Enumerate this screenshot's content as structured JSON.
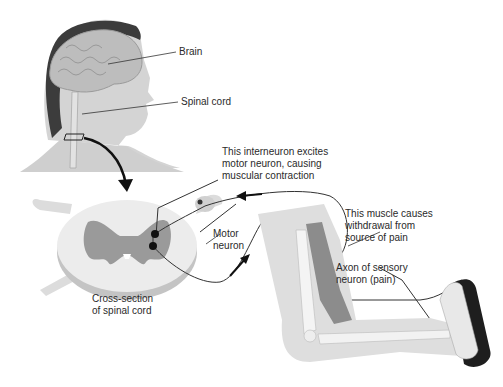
{
  "diagram": {
    "type": "anatomical-illustration",
    "labels": {
      "brain": "Brain",
      "spinal_cord": "Spinal cord",
      "interneuron": [
        "This interneuron excites",
        "motor neuron, causing",
        "muscular contraction"
      ],
      "motor_neuron": [
        "Motor",
        "neuron"
      ],
      "muscle": [
        "This muscle causes",
        "withdrawal from",
        "source of pain"
      ],
      "sensory_axon": [
        "Axon of sensory",
        "neuron (pain)"
      ],
      "cross_section": [
        "Cross-section",
        "of spinal cord"
      ]
    },
    "colors": {
      "gray_matter": "#9a9a9a",
      "white_matter": "#e6e6e6",
      "muscle": "#8c8c8c",
      "skin": "#d9d9d9",
      "hair": "#3a3a3a",
      "line": "#333333",
      "arrow": "#111111",
      "iron": "#1e1e1e"
    }
  }
}
